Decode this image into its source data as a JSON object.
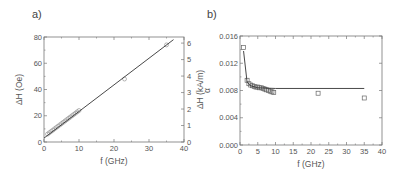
{
  "chart_data": [
    {
      "panel_label": "a)",
      "type": "scatter",
      "title": "",
      "xlabel": "f (GHz)",
      "ylabel": "ΔH (Oe)",
      "ylabel_right": "ΔH (kA/m)",
      "xlim": [
        0,
        40
      ],
      "ylim": [
        0,
        80
      ],
      "ylim_right": [
        0,
        6.37
      ],
      "xticks": [
        "0",
        "10",
        "20",
        "30",
        "40"
      ],
      "yticks": [
        "0",
        "20",
        "40",
        "60",
        "80"
      ],
      "yticks_right": [
        "0",
        "1",
        "2",
        "3",
        "4",
        "5",
        "6"
      ],
      "grid": false,
      "series": [
        {
          "name": "data",
          "marker": "open-circle",
          "x": [
            1,
            1.5,
            2,
            2.5,
            3,
            3.5,
            4,
            4.5,
            5,
            5.5,
            6,
            6.5,
            7,
            7.5,
            8,
            8.5,
            9,
            9.5,
            10,
            23,
            35
          ],
          "y": [
            6,
            7,
            8,
            9,
            10,
            11,
            12,
            13,
            14,
            15,
            16,
            17,
            18,
            19,
            20,
            21,
            22,
            23,
            24,
            48,
            74
          ]
        },
        {
          "name": "linear fit",
          "type": "line",
          "x": [
            0,
            37
          ],
          "y": [
            3,
            78
          ]
        }
      ]
    },
    {
      "panel_label": "b)",
      "type": "scatter",
      "title": "",
      "xlabel": "f (GHz)",
      "ylabel": "α",
      "xlim": [
        0,
        40
      ],
      "ylim": [
        0,
        0.016
      ],
      "xticks": [
        "0",
        "5",
        "10",
        "15",
        "20",
        "25",
        "30",
        "35",
        "40"
      ],
      "yticks": [
        "0.000",
        "0.004",
        "0.008",
        "0.012",
        "0.016"
      ],
      "grid": false,
      "series": [
        {
          "name": "data",
          "marker": "open-square",
          "x": [
            1,
            2,
            2.5,
            3,
            3.5,
            4,
            4.5,
            5,
            5.5,
            6,
            6.5,
            7,
            7.5,
            8,
            8.5,
            9,
            9.5,
            22,
            35
          ],
          "y": [
            0.0143,
            0.0095,
            0.009,
            0.0088,
            0.0087,
            0.0086,
            0.0085,
            0.0085,
            0.0084,
            0.0084,
            0.0083,
            0.0082,
            0.0081,
            0.008,
            0.0079,
            0.0078,
            0.0077,
            0.0076,
            0.0069
          ]
        },
        {
          "name": "fit",
          "type": "line",
          "x": [
            1,
            2,
            3,
            5,
            10,
            20,
            35
          ],
          "y": [
            0.0138,
            0.0092,
            0.0087,
            0.0084,
            0.0083,
            0.0083,
            0.0083
          ]
        }
      ]
    }
  ]
}
